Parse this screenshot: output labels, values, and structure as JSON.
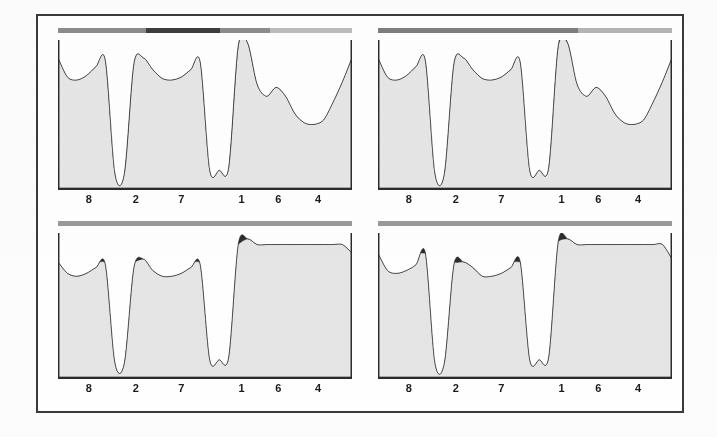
{
  "figure": {
    "colors": {
      "light_fill": "#e6e6e6",
      "dark_fill": "#2d2d2d",
      "outline": "#1e1e1e",
      "axis": "#2b2b2b",
      "frame": "#3a3a3a",
      "background": "#ffffff",
      "scan_bar_light": "#a8a8a8",
      "scan_bar_dark": "#3d3d3d",
      "scan_bar_mid": "#8c8c8c"
    },
    "panel_count": 4
  },
  "chart_data": [
    {
      "type": "area",
      "name": "panel-top-left",
      "title": "",
      "xlabel": "",
      "ylabel": "",
      "grid": false,
      "legend": "none",
      "xlim": [
        0,
        100
      ],
      "ylim": [
        0,
        100
      ],
      "categories": [
        "8",
        "2",
        "7",
        "1",
        "6",
        "4"
      ],
      "tick_positions_pct": [
        10.5,
        26.5,
        42.0,
        62.5,
        75.0,
        88.5
      ],
      "series": [
        {
          "name": "total-profile",
          "fill": "#e6e6e6",
          "description": "Outer light-grey envelope: high plateau at 8, deep narrow notch at 2, plateau at 7, deep wide notch at 1, tall sharp peak after 1, shoulder at 6, broad shallow basin at 4, rising at right edge",
          "values_pct": [
            88,
            75,
            73,
            76,
            82,
            86,
            10,
            10,
            84,
            88,
            80,
            74,
            73,
            75,
            80,
            85,
            12,
            12,
            14,
            96,
            98,
            70,
            62,
            68,
            62,
            50,
            44,
            43,
            46,
            58,
            72,
            88
          ]
        },
        {
          "name": "dark-subregion",
          "fill": "#2d2d2d",
          "description": "Dark band hugging the top of the envelope: crescent over 8, small cap in notch 2, crescent over 7, cap in notch 1, small shoulder at 6, crescent over basin 4",
          "values_pct": [
            88,
            84,
            83,
            85,
            88,
            88,
            13,
            13,
            88,
            88,
            86,
            84,
            84,
            85,
            87,
            88,
            18,
            18,
            19,
            96,
            98,
            72,
            70,
            70,
            68,
            60,
            58,
            58,
            60,
            68,
            78,
            88
          ]
        }
      ]
    },
    {
      "type": "area",
      "name": "panel-top-right",
      "title": "",
      "xlabel": "",
      "ylabel": "",
      "grid": false,
      "legend": "none",
      "xlim": [
        0,
        100
      ],
      "ylim": [
        0,
        100
      ],
      "categories": [
        "8",
        "2",
        "7",
        "1",
        "6",
        "4"
      ],
      "tick_positions_pct": [
        10.5,
        26.5,
        42.0,
        62.5,
        75.0,
        88.5
      ],
      "series": [
        {
          "name": "total-profile",
          "fill": "#e6e6e6",
          "description": "Same envelope as top-left panel",
          "values_pct": [
            88,
            75,
            73,
            76,
            82,
            86,
            10,
            10,
            84,
            88,
            80,
            74,
            73,
            75,
            80,
            85,
            12,
            12,
            14,
            96,
            98,
            70,
            62,
            68,
            62,
            50,
            44,
            43,
            46,
            58,
            72,
            88
          ]
        },
        {
          "name": "dark-subregion",
          "fill": "#2d2d2d",
          "description": "Thicker dark band than top-left: deeper crescents over 8 and 7, filled notch 2 and notch 1 caps larger, wide dark basin across 4",
          "values_pct": [
            88,
            82,
            80,
            82,
            86,
            88,
            30,
            30,
            88,
            88,
            84,
            80,
            79,
            80,
            84,
            88,
            36,
            36,
            38,
            96,
            98,
            76,
            74,
            74,
            74,
            70,
            66,
            66,
            70,
            78,
            84,
            88
          ]
        }
      ]
    },
    {
      "type": "area",
      "name": "panel-bottom-left",
      "title": "",
      "xlabel": "",
      "ylabel": "",
      "grid": false,
      "legend": "none",
      "xlim": [
        0,
        100
      ],
      "ylim": [
        0,
        100
      ],
      "categories": [
        "8",
        "2",
        "7",
        "1",
        "6",
        "4"
      ],
      "tick_positions_pct": [
        10.5,
        26.5,
        42.0,
        62.5,
        75.0,
        88.5
      ],
      "series": [
        {
          "name": "total-profile",
          "fill": "#e6e6e6",
          "description": "Lower flat-topped envelope; tall dark block dominates the 6-4 region",
          "values_pct": [
            80,
            72,
            70,
            72,
            76,
            78,
            10,
            10,
            76,
            82,
            74,
            70,
            70,
            72,
            76,
            78,
            12,
            12,
            14,
            92,
            96,
            92,
            92,
            92,
            92,
            92,
            92,
            92,
            92,
            92,
            92,
            86
          ]
        },
        {
          "name": "dark-subregion",
          "fill": "#2d2d2d",
          "description": "Dominant dark region: crescents over 8 and 7, fully dark narrow notch 2, fully dark notch 1, and a large dark mass spanning 6 through 4 with an internal lobed lower boundary",
          "values_pct": [
            80,
            78,
            76,
            78,
            80,
            80,
            80,
            80,
            80,
            82,
            80,
            78,
            77,
            78,
            80,
            80,
            80,
            80,
            82,
            92,
            96,
            96,
            96,
            96,
            96,
            96,
            96,
            96,
            96,
            96,
            96,
            86
          ]
        }
      ]
    },
    {
      "type": "area",
      "name": "panel-bottom-right",
      "title": "",
      "xlabel": "",
      "ylabel": "",
      "grid": false,
      "legend": "none",
      "xlim": [
        0,
        100
      ],
      "ylim": [
        0,
        100
      ],
      "categories": [
        "8",
        "2",
        "7",
        "1",
        "6",
        "4"
      ],
      "tick_positions_pct": [
        10.5,
        26.5,
        42.0,
        62.5,
        75.0,
        88.5
      ],
      "series": [
        {
          "name": "total-profile",
          "fill": "#e6e6e6",
          "description": "Similar to bottom-left but with the 8 plateau raised to the same level as the 2 notch rim and a slightly narrower dark mass on the right",
          "values_pct": [
            86,
            74,
            72,
            74,
            78,
            86,
            10,
            10,
            78,
            80,
            76,
            70,
            70,
            72,
            76,
            80,
            12,
            12,
            14,
            94,
            96,
            92,
            92,
            92,
            92,
            92,
            92,
            92,
            92,
            92,
            92,
            82
          ]
        },
        {
          "name": "dark-subregion",
          "fill": "#2d2d2d",
          "description": "Dark region covering nearly all of the upper envelope; fully dark notch 2 and notch 1, big dark block over 6-4 with lobed interior edge",
          "values_pct": [
            86,
            84,
            82,
            84,
            86,
            86,
            86,
            86,
            80,
            80,
            80,
            78,
            78,
            78,
            80,
            80,
            80,
            80,
            82,
            94,
            96,
            96,
            96,
            96,
            96,
            96,
            96,
            96,
            96,
            96,
            96,
            82
          ]
        }
      ]
    }
  ],
  "scan_bars": [
    {
      "name": "scan-bar-top-left",
      "segments": [
        {
          "start_pct": 0,
          "width_pct": 30,
          "color": "#8c8c8c"
        },
        {
          "start_pct": 30,
          "width_pct": 25,
          "color": "#3d3d3d"
        },
        {
          "start_pct": 55,
          "width_pct": 17,
          "color": "#8c8c8c"
        },
        {
          "start_pct": 72,
          "width_pct": 28,
          "color": "#bdbdbd"
        }
      ]
    },
    {
      "name": "scan-bar-top-right",
      "segments": [
        {
          "start_pct": 0,
          "width_pct": 68,
          "color": "#7e7e7e"
        },
        {
          "start_pct": 68,
          "width_pct": 32,
          "color": "#b5b5b5"
        }
      ]
    },
    {
      "name": "scan-bar-bottom-left",
      "segments": [
        {
          "start_pct": 0,
          "width_pct": 100,
          "color": "#9a9a9a"
        }
      ]
    },
    {
      "name": "scan-bar-bottom-right",
      "segments": [
        {
          "start_pct": 0,
          "width_pct": 100,
          "color": "#9a9a9a"
        }
      ]
    }
  ]
}
